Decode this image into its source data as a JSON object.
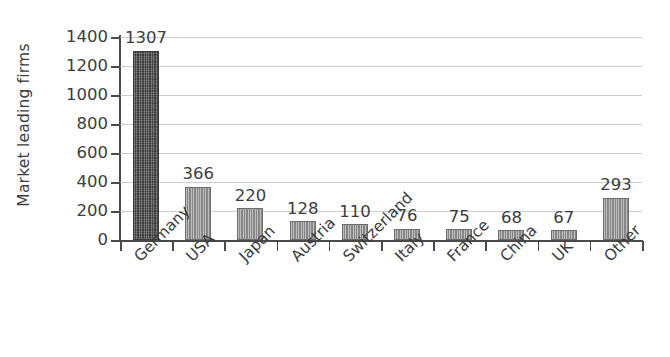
{
  "chart_data": {
    "type": "bar",
    "title": "",
    "subtitle": "",
    "xlabel": "",
    "ylabel": "Market leading firms",
    "ylim": [
      0,
      1400
    ],
    "ytick_step": 200,
    "yticks": [
      "1400",
      "1200",
      "1000",
      "800",
      "600",
      "400",
      "200",
      "0"
    ],
    "grid": true,
    "legend": false,
    "legend_position": "none",
    "categories": [
      "Germany",
      "USA",
      "Japan",
      "Austria",
      "Switzerland",
      "Italy",
      "France",
      "China",
      "UK",
      "Other"
    ],
    "values": [
      1307,
      366,
      220,
      128,
      110,
      76,
      75,
      68,
      67,
      293
    ],
    "value_labels": [
      "1307",
      "366",
      "220",
      "128",
      "110",
      "76",
      "75",
      "68",
      "67",
      "293"
    ],
    "bar_styles": [
      "dark",
      "light",
      "light",
      "light",
      "light",
      "light",
      "light",
      "light",
      "light",
      "light"
    ],
    "colors": {
      "bar_dark": "#4a4a4a",
      "bar_light": "#8d8d8d",
      "gridline": "#b9b9b9",
      "axis": "#4a4a4a",
      "text": "#3d3d3d",
      "background": "#ffffff"
    }
  }
}
